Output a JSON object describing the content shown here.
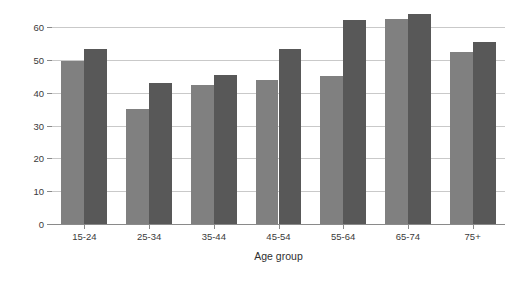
{
  "chart_data": {
    "type": "bar",
    "title": "",
    "xlabel": "Age group",
    "ylabel": "",
    "categories": [
      "15-24",
      "25-34",
      "35-44",
      "45-54",
      "55-64",
      "65-74",
      "75+"
    ],
    "series": [
      {
        "name": "Series 1",
        "color": "#808080",
        "values": [
          49.5,
          35.0,
          42.2,
          44.0,
          45.2,
          62.5,
          52.3
        ]
      },
      {
        "name": "Series 2",
        "color": "#585858",
        "values": [
          53.3,
          43.1,
          45.3,
          53.2,
          62.2,
          64.0,
          55.4
        ]
      }
    ],
    "ylim": [
      0,
      60
    ],
    "yticks": [
      0,
      10,
      20,
      30,
      40,
      50,
      60
    ],
    "ytick_labels": [
      "0",
      "10",
      "20",
      "30",
      "40",
      "50",
      "60"
    ],
    "grid": true,
    "legend": "none",
    "background": "#ffffff",
    "gridline_color": "#c9c9c9",
    "axis_color": "#8a8a8a",
    "text_color": "#3a3a3a"
  }
}
